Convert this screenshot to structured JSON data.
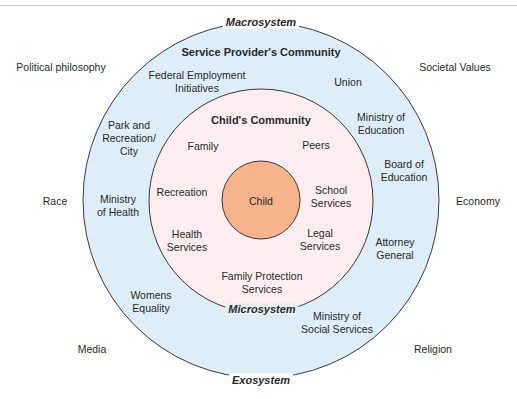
{
  "colors": {
    "exosystem_fill": "#deedf8",
    "microsystem_fill": "#fbedf0",
    "child_fill": "#f7b38c",
    "stroke": "#3a3a3a"
  },
  "macrosystem": {
    "label": "Macrosystem",
    "factors": {
      "political_philosophy": "Political philosophy",
      "societal_values": "Societal Values",
      "race": "Race",
      "economy": "Economy",
      "media": "Media",
      "religion": "Religion"
    }
  },
  "exosystem": {
    "label": "Exosystem",
    "title": "Service Provider's Community",
    "items": {
      "federal_employment_1": "Federal Employment",
      "federal_employment_2": "Initiatives",
      "union": "Union",
      "park_1": "Park and",
      "park_2": "Recreation/",
      "park_3": "City",
      "ministry_education_1": "Ministry of",
      "ministry_education_2": "Education",
      "board_education_1": "Board of",
      "board_education_2": "Education",
      "ministry_health_1": "Ministry",
      "ministry_health_2": "of Health",
      "attorney_1": "Attorney",
      "attorney_2": "General",
      "womens_1": "Womens",
      "womens_2": "Equality",
      "social_services_1": "Ministry of",
      "social_services_2": "Social Services"
    }
  },
  "microsystem": {
    "label": "Microsystem",
    "title": "Child's Community",
    "items": {
      "family": "Family",
      "peers": "Peers",
      "recreation": "Recreation",
      "school_1": "School",
      "school_2": "Services",
      "health_1": "Health",
      "health_2": "Services",
      "legal_1": "Legal",
      "legal_2": "Services",
      "family_protection_1": "Family Protection",
      "family_protection_2": "Services"
    }
  },
  "center": {
    "label": "Child"
  }
}
